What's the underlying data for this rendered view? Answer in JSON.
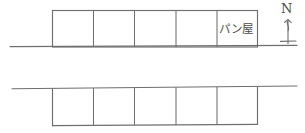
{
  "figure": {
    "kind": "hand-drawn-location-map",
    "description_title": "Neighborhood block sketch map",
    "stroke_color": "#6e6e6e",
    "accent_color": "#4a4a4a",
    "background_color": "#ffffff",
    "width": 305,
    "height": 133
  },
  "compass": {
    "label": "N",
    "icon_name": "north-arrow-icon"
  },
  "roads": [
    {
      "name": "upper-road",
      "x1": 10,
      "y1": 46.5,
      "x2": 297,
      "y2": 45.5
    },
    {
      "name": "lower-road",
      "x1": 12,
      "y1": 88.5,
      "x2": 297,
      "y2": 86.0
    }
  ],
  "blocks": [
    {
      "name": "upper-block",
      "x": 52,
      "y": 10,
      "width": 206,
      "height": 37,
      "cells": [
        {
          "label": "",
          "name": "upper-lot-1"
        },
        {
          "label": "",
          "name": "upper-lot-2"
        },
        {
          "label": "",
          "name": "upper-lot-3"
        },
        {
          "label": "",
          "name": "upper-lot-4"
        },
        {
          "label": "パン屋",
          "name": "upper-lot-5-bakery"
        }
      ]
    },
    {
      "name": "lower-block",
      "x": 52,
      "y": 88,
      "width": 206,
      "height": 38,
      "cells": [
        {
          "label": "",
          "name": "lower-lot-1"
        },
        {
          "label": "",
          "name": "lower-lot-2"
        },
        {
          "label": "",
          "name": "lower-lot-3"
        },
        {
          "label": "",
          "name": "lower-lot-4"
        },
        {
          "label": "",
          "name": "lower-lot-5"
        }
      ]
    }
  ],
  "labels": {
    "bakery": "パン屋"
  }
}
